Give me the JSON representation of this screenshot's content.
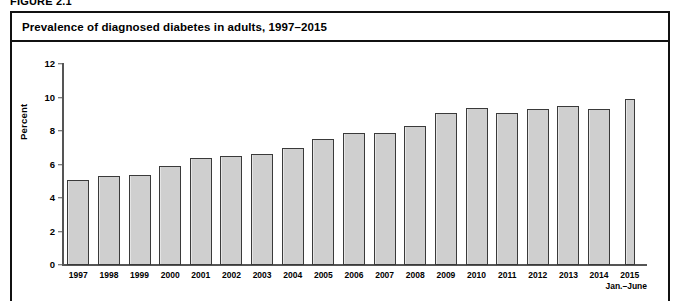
{
  "figure": {
    "number_label": "FIGURE 2.1",
    "title": "Prevalence of diagnosed diabetes in adults, 1997–2015"
  },
  "axes": {
    "ylabel": "Percent",
    "yticks": [
      "0",
      "2",
      "4",
      "6",
      "8",
      "10",
      "12"
    ],
    "ymin": 0,
    "ymax": 12,
    "ystep": 2,
    "last_category_sub_label": "Jan.–June"
  },
  "colors": {
    "bar_fill": "#cfcfcf",
    "bar_border": "#3a3a3a",
    "axis": "#555555",
    "frame": "#111111",
    "text": "#000000",
    "background": "#ffffff"
  },
  "chart_data": {
    "type": "bar",
    "title": "Prevalence of diagnosed diabetes in adults, 1997–2015",
    "xlabel": "",
    "ylabel": "Percent",
    "ylim": [
      0,
      12
    ],
    "ytick_values": [
      0,
      2,
      4,
      6,
      8,
      10,
      12
    ],
    "grid": false,
    "legend": false,
    "categories": [
      "1997",
      "1998",
      "1999",
      "2000",
      "2001",
      "2002",
      "2003",
      "2004",
      "2005",
      "2006",
      "2007",
      "2008",
      "2009",
      "2010",
      "2011",
      "2012",
      "2013",
      "2014",
      "2015"
    ],
    "values": [
      5.1,
      5.3,
      5.4,
      5.9,
      6.4,
      6.5,
      6.6,
      7.0,
      7.5,
      7.9,
      7.9,
      8.3,
      9.1,
      9.35,
      9.1,
      9.3,
      9.5,
      9.3,
      9.9
    ],
    "annotations": [
      {
        "category": "2015",
        "text": "Jan.–June",
        "note": "partial-year estimate; bar drawn narrower than other years"
      }
    ]
  },
  "footnote_sliver": ""
}
